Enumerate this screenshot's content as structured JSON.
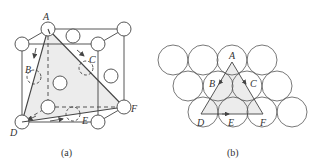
{
  "figure_a": {
    "caption": "(a)",
    "labels": {
      "A": "A",
      "B": "B",
      "C": "C",
      "D": "D",
      "E": "E",
      "F": "F"
    }
  },
  "figure_b": {
    "caption": "(b)",
    "labels": {
      "A": "A",
      "B": "B",
      "C": "C",
      "D": "D",
      "E": "E",
      "F": "F"
    }
  },
  "colors": {
    "stroke": "#444444",
    "shade": "#ececec",
    "background": "#ffffff"
  }
}
